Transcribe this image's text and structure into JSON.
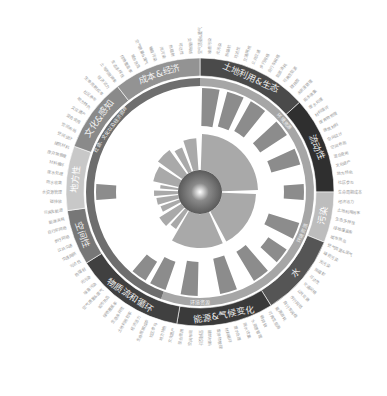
{
  "chart_data": {
    "type": "radial-bar-sunburst",
    "title": "",
    "center": {
      "x": 200,
      "y": 192
    },
    "outer_ring": {
      "r_inner": 116,
      "r_outer": 134,
      "segments": [
        {
          "label": "土地利用&生态",
          "start": -90,
          "end": -42,
          "color": "#4a4a4a",
          "text_color": "#eeeeee"
        },
        {
          "label": "流动性",
          "start": -42,
          "end": 0,
          "color": "#2f2f2f",
          "text_color": "#eeeeee"
        },
        {
          "label": "污染",
          "start": 0,
          "end": 22,
          "color": "#bdbdbd",
          "text_color": "#ffffff"
        },
        {
          "label": "水",
          "start": 22,
          "end": 58,
          "color": "#555555",
          "text_color": "#eeeeee"
        },
        {
          "label": "能源&气候变化",
          "start": 58,
          "end": 100,
          "color": "#3a3a3a",
          "text_color": "#eeeeee"
        },
        {
          "label": "物质流和循环",
          "start": 100,
          "end": 148,
          "color": "#404040",
          "text_color": "#eeeeee"
        },
        {
          "label": "空间性",
          "start": 148,
          "end": 172,
          "color": "#777777",
          "text_color": "#eeeeee"
        },
        {
          "label": "地方性",
          "start": 172,
          "end": 200,
          "color": "#c8c8c8",
          "text_color": "#ffffff"
        },
        {
          "label": "文化&感知",
          "start": 200,
          "end": 232,
          "color": "#8a8a8a",
          "text_color": "#f2f2f2"
        },
        {
          "label": "成本&经济",
          "start": 232,
          "end": 270,
          "color": "#939393",
          "text_color": "#f2f2f2"
        }
      ]
    },
    "inner_ring": {
      "r_inner": 106,
      "r_outer": 114,
      "segments": [
        {
          "label": "环境资源",
          "start": -90,
          "end": 110,
          "color": "#a6a6a6"
        },
        {
          "label": "社会、文化以及经济资源",
          "start": 110,
          "end": 270,
          "color": "#6e6e6e"
        }
      ],
      "sub_labels": [
        {
          "label": "环境资源",
          "angle": -40
        },
        {
          "label": "环境资源",
          "angle": 22
        },
        {
          "label": "环境资源",
          "angle": 90
        },
        {
          "label": "社会、文化以及经济资源",
          "angle": 215
        }
      ]
    },
    "outer_bars": {
      "r_inner": 64,
      "items": [
        {
          "angle": -84,
          "len": 38
        },
        {
          "angle": -70,
          "len": 36
        },
        {
          "angle": -56,
          "len": 34
        },
        {
          "angle": -38,
          "len": 32
        },
        {
          "angle": -20,
          "len": 30
        },
        {
          "angle": 0,
          "len": 20
        },
        {
          "angle": 22,
          "len": 32
        },
        {
          "angle": 38,
          "len": 22
        },
        {
          "angle": 54,
          "len": 34
        },
        {
          "angle": 74,
          "len": 36
        },
        {
          "angle": 96,
          "len": 34
        },
        {
          "angle": 114,
          "len": 30
        },
        {
          "angle": 126,
          "len": 22
        },
        {
          "angle": 180,
          "len": 20
        }
      ]
    },
    "inner_bars": {
      "r_inner": 22,
      "items": [
        {
          "start": -88,
          "end": -2,
          "len": 36
        },
        {
          "start": 2,
          "end": 62,
          "len": 34
        },
        {
          "start": 66,
          "end": 120,
          "len": 34
        },
        {
          "start": 123,
          "end": 132,
          "len": 22
        },
        {
          "start": 135,
          "end": 148,
          "len": 26
        },
        {
          "start": 152,
          "end": 160,
          "len": 20
        },
        {
          "start": 163,
          "end": 172,
          "len": 22
        },
        {
          "start": 175,
          "end": 182,
          "len": 24
        },
        {
          "start": 185,
          "end": 190,
          "len": 18
        },
        {
          "start": 193,
          "end": 212,
          "len": 26
        },
        {
          "start": 216,
          "end": 234,
          "len": 30
        },
        {
          "start": 238,
          "end": 248,
          "len": 26
        },
        {
          "start": 252,
          "end": 266,
          "len": 32
        }
      ]
    },
    "center_sphere": {
      "r": 22,
      "color": "#6b6b6b",
      "highlight": "#ffffff"
    },
    "outer_text_labels": {
      "count": 96,
      "color": "#9a9a9a",
      "note": "tiny rotated Chinese indicator labels around perimeter",
      "samples": [
        "空气质量&废气",
        "噪音污染",
        "光污染",
        "热辐射",
        "可达性",
        "交通网络",
        "公共交通",
        "步行网络",
        "自行车网络",
        "能源消耗",
        "可再生能源",
        "碳排放",
        "水资源管理",
        "雨水收集",
        "废水处理",
        "材料循环",
        "废弃物管理",
        "建筑材料",
        "空间设计",
        "空间布局",
        "混合使用",
        "文化遗产",
        "地方特色",
        "社区参与",
        "生命周期成本",
        "经济活力",
        "土地利用效率",
        "生态多样性",
        "绿地覆盖率",
        "城市热岛"
      ]
    }
  }
}
